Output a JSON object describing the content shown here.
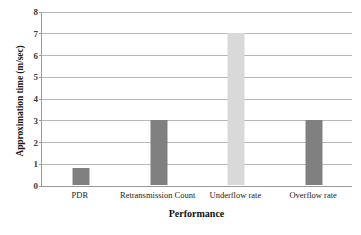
{
  "chart_data": {
    "type": "bar",
    "title": "",
    "xlabel": "Performance",
    "ylabel": "Approximation time (m/sec)",
    "categories": [
      "PDR",
      "Retransmission Count",
      "Underflow rate",
      "Overflow rate"
    ],
    "values": [
      0.8,
      3,
      7,
      3
    ],
    "bar_colors": [
      "#808080",
      "#808080",
      "#d9d9d9",
      "#808080"
    ],
    "ylim": [
      0,
      8
    ],
    "yticks": [
      0,
      1,
      2,
      3,
      4,
      5,
      6,
      7,
      8
    ],
    "ytick_labels": [
      "0",
      "1",
      "2",
      "3",
      "4",
      "5",
      "6",
      "7",
      "8"
    ],
    "grid": true,
    "grid_axis": "y",
    "legend": false,
    "legend_position": "none",
    "background_color": "#ffffff",
    "gridline_color": "#b8b8b8",
    "axis_color": "#9a9a9a"
  }
}
